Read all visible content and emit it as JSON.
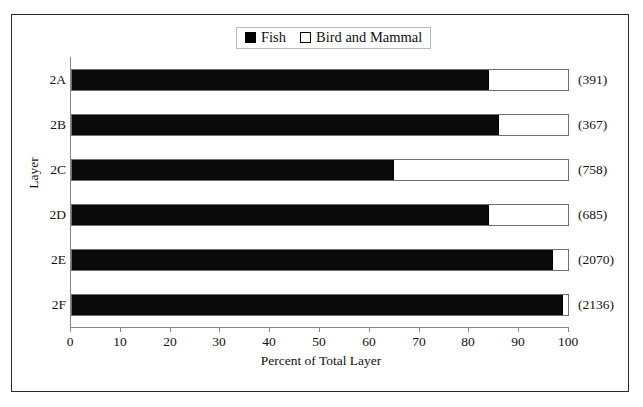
{
  "chart_data": {
    "type": "bar",
    "orientation": "horizontal",
    "stacked": true,
    "title": "",
    "xlabel": "Percent of Total Layer",
    "ylabel": "Layer",
    "categories": [
      "2A",
      "2B",
      "2C",
      "2D",
      "2E",
      "2F"
    ],
    "series": [
      {
        "name": "Fish",
        "color": "#000000",
        "values": [
          84,
          86,
          65,
          84,
          97,
          99
        ]
      },
      {
        "name": "Bird and Mammal",
        "color": "#ffffff",
        "values": [
          16,
          14,
          35,
          16,
          3,
          1
        ]
      }
    ],
    "annotations": [
      "(391)",
      "(367)",
      "(758)",
      "(685)",
      "(2070)",
      "(2136)"
    ],
    "xlim": [
      0,
      100
    ],
    "xticks": [
      0,
      10,
      20,
      30,
      40,
      50,
      60,
      70,
      80,
      90,
      100
    ],
    "xtick_labels": [
      "0",
      "10",
      "20",
      "30",
      "40",
      "50",
      "60",
      "70",
      "80",
      "90",
      "100"
    ],
    "grid": false,
    "legend_position": "top-center"
  },
  "legend": {
    "items": [
      {
        "label": "Fish",
        "swatch": "filled-square-icon"
      },
      {
        "label": "Bird and Mammal",
        "swatch": "hollow-square-icon"
      }
    ]
  },
  "axes": {
    "x_title": "Percent of Total Layer",
    "y_title": "Layer"
  }
}
